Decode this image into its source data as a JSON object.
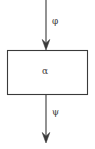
{
  "figure": {
    "type": "block-diagram",
    "background_color": "#ffffff",
    "stroke_color": "#3a3a3a",
    "block": {
      "label": "α",
      "label_name": "alpha",
      "x": 7,
      "y": 50,
      "width": 81,
      "height": 45
    },
    "input_arrow": {
      "label": "φ",
      "label_name": "phi",
      "direction": "down",
      "from_y": 0,
      "to_y": 50,
      "x": 46
    },
    "output_arrow": {
      "label": "ψ",
      "label_name": "psi",
      "direction": "down",
      "from_y": 95,
      "to_y": 143,
      "x": 46
    }
  }
}
